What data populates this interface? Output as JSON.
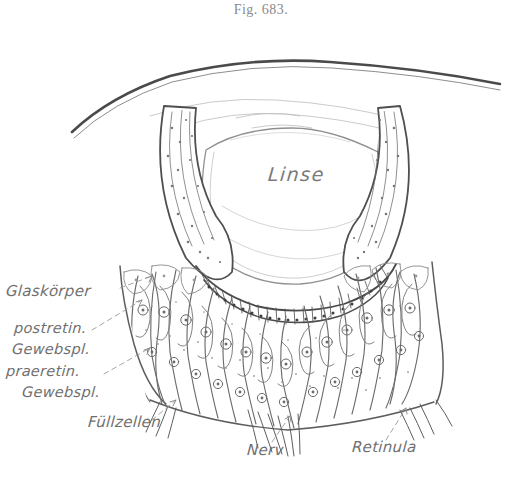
{
  "figure": {
    "caption": "Fig. 683.",
    "language": "German",
    "style": "engraved line drawing, sepia ink on white paper"
  },
  "labels": {
    "lens": "Linse",
    "vitreous": "Glaskörper",
    "postretinal_line1": "postretin.",
    "postretinal_line2": "Gewebspl.",
    "preretinal_line1": "praeretin.",
    "preretinal_line2": "Gewebspl.",
    "filler_cells": "Füllzellen",
    "nerve": "Nerv",
    "retinula": "Retinula"
  },
  "colors": {
    "ink": "#6b6b6b",
    "ink_dark": "#4a4a4a",
    "ink_light": "#9a9a9a",
    "paper": "#ffffff",
    "caption": "#8a8a8a"
  }
}
